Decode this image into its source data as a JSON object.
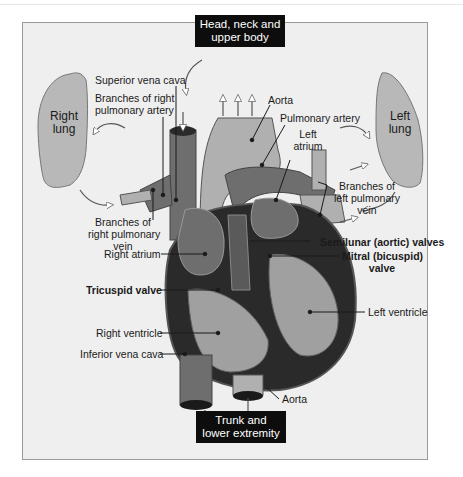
{
  "figure": {
    "boxes": {
      "top": "Head, neck and upper body",
      "top_line1": "Head, neck and",
      "top_line2": "upper body",
      "bottom_line1": "Trunk and",
      "bottom_line2": "lower extremity"
    },
    "lungs": {
      "right_line1": "Right",
      "right_line2": "lung",
      "left_line1": "Left",
      "left_line2": "lung"
    },
    "labels": {
      "superior_vena_cava": "Superior vena cava",
      "branches_right_pa_1": "Branches of right",
      "branches_right_pa_2": "pulmonary artery",
      "aorta_top": "Aorta",
      "pulmonary_artery": "Pulmonary artery",
      "left_atrium_1": "Left",
      "left_atrium_2": "atrium",
      "branches_left_pv_1": "Branches of",
      "branches_left_pv_2": "left pulmonary",
      "branches_left_pv_3": "vein",
      "branches_right_pv_1": "Branches of",
      "branches_right_pv_2": "right pulmonary",
      "branches_right_pv_3": "vein",
      "right_atrium": "Right atrium",
      "semilunar_valves": "Semilunar (aortic) valves",
      "mitral_1": "Mitral (bicuspid)",
      "mitral_2": "valve",
      "tricuspid_valve": "Tricuspid valve",
      "left_ventricle": "Left ventricle",
      "right_ventricle": "Right ventricle",
      "inferior_vena_cava": "Inferior vena cava",
      "aorta_bottom": "Aorta"
    },
    "colors": {
      "background": "#efefef",
      "lung": "#b8b8b8",
      "vessel_dark": "#6e6e6e",
      "vessel_light": "#b0b0b0",
      "muscle_dark": "#2a2a2a",
      "label_box": "#0d0d0d"
    }
  }
}
